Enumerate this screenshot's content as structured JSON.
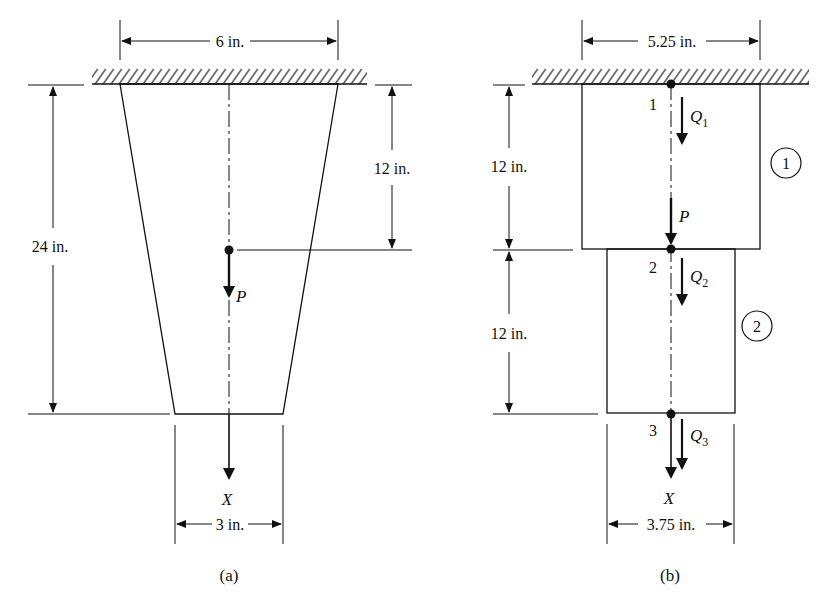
{
  "figure_a": {
    "caption": "(a)",
    "top_width_label": "6 in.",
    "bottom_width_label": "3 in.",
    "total_length_label": "24 in.",
    "load_position_label": "12 in.",
    "load_label": "P",
    "axis_label": "X"
  },
  "figure_b": {
    "caption": "(b)",
    "top_width_label": "5.25 in.",
    "bottom_width_label": "3.75 in.",
    "element1_length_label": "12 in.",
    "element2_length_label": "12 in.",
    "load_label": "P",
    "axis_label": "X",
    "nodes": [
      {
        "number": "1",
        "force_label": "Q",
        "force_sub": "1"
      },
      {
        "number": "2",
        "force_label": "Q",
        "force_sub": "2"
      },
      {
        "number": "3",
        "force_label": "Q",
        "force_sub": "3"
      }
    ],
    "elements": [
      {
        "number": "1"
      },
      {
        "number": "2"
      }
    ]
  },
  "colors": {
    "ink": "#111111",
    "background": "#ffffff"
  }
}
